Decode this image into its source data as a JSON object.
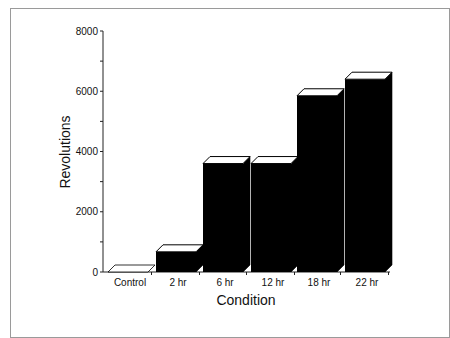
{
  "chart_data": {
    "type": "bar",
    "title": "",
    "xlabel": "Condition",
    "ylabel": "Revolutions",
    "categories": [
      "Control",
      "2 hr",
      "6 hr",
      "12 hr",
      "18 hr",
      "22 hr"
    ],
    "values": [
      0,
      670,
      3600,
      3600,
      5850,
      6400
    ],
    "ylim": [
      0,
      8000
    ],
    "yticks": [
      0,
      2000,
      4000,
      6000,
      8000
    ],
    "ytick_labels": [
      "0",
      "2000",
      "4000",
      "6000",
      "8000"
    ],
    "grid": false,
    "legend": null,
    "style": "3d-bar",
    "bar_color": "#000000",
    "bar_top_color": "#ffffff"
  }
}
